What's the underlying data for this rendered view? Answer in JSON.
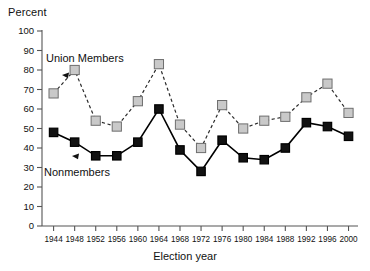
{
  "chart_data": {
    "type": "line",
    "title": "",
    "xlabel": "Election year",
    "ylabel": "Percent",
    "ylim": [
      0,
      100
    ],
    "ytick_step": 10,
    "yticks": [
      0,
      10,
      20,
      30,
      40,
      50,
      60,
      70,
      80,
      90,
      100
    ],
    "grid": false,
    "legend_position": "inline-annotations",
    "categories": [
      1944,
      1948,
      1952,
      1956,
      1960,
      1964,
      1968,
      1972,
      1976,
      1980,
      1984,
      1988,
      1992,
      1996,
      2000
    ],
    "xtick_labels": [
      "1944",
      "1948",
      "1952",
      "1956",
      "1960",
      "1964",
      "1968",
      "1972",
      "1976",
      "1980",
      "1984",
      "1988",
      "1992",
      "1996",
      "2000"
    ],
    "series": [
      {
        "name": "Union Members",
        "color": "#c9c9c9",
        "marker_edge": "#6e6e6e",
        "line_style": "dashed",
        "values": [
          68,
          80,
          54,
          51,
          64,
          83,
          52,
          40,
          62,
          50,
          54,
          56,
          66,
          73,
          58
        ]
      },
      {
        "name": "Nonmembers",
        "color": "#121212",
        "marker_edge": "#000000",
        "line_style": "solid",
        "values": [
          48,
          43,
          36,
          36,
          43,
          60,
          39,
          28,
          44,
          35,
          34,
          40,
          53,
          51,
          46
        ]
      }
    ],
    "annotations": [
      {
        "text": "Union Members",
        "series": "Union Members",
        "arrow": "left-pointer"
      },
      {
        "text": "Nonmembers",
        "series": "Nonmembers",
        "arrow": "left-pointer"
      }
    ]
  },
  "labels": {
    "y_axis_title": "Percent",
    "x_axis_title": "Election year",
    "union_members": "Union Members",
    "nonmembers": "Nonmembers"
  },
  "colors": {
    "union_fill": "#c9c9c9",
    "union_edge": "#6e6e6e",
    "nonmember_fill": "#121212",
    "axis": "#555555",
    "text": "#111111",
    "background": "#ffffff"
  }
}
